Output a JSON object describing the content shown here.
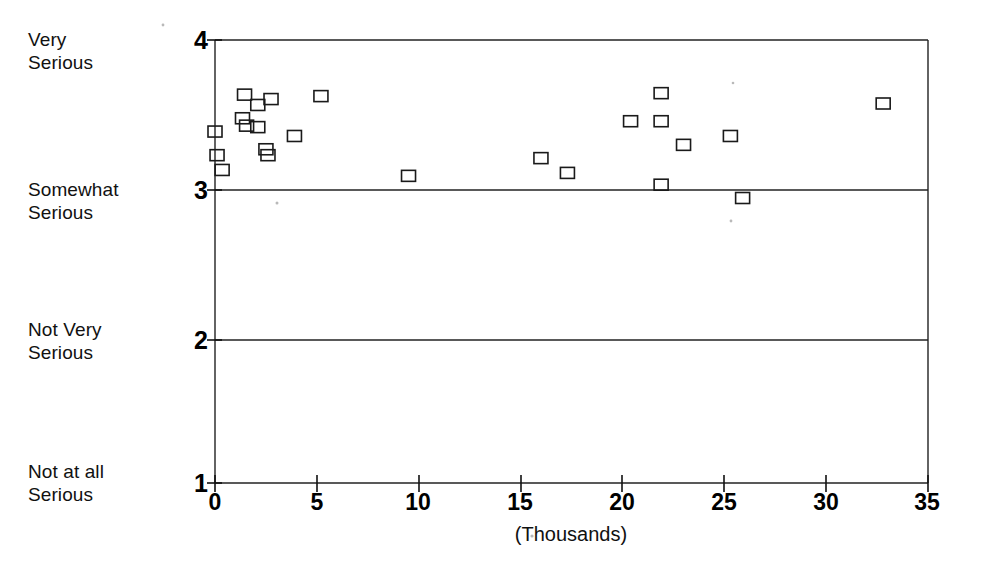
{
  "chart_data": {
    "type": "scatter",
    "title": "",
    "subtitle": "",
    "xlabel": "(Thousands)",
    "ylabel": "",
    "xlim": [
      0,
      35
    ],
    "ylim": [
      1,
      4
    ],
    "grid": true,
    "legend": null,
    "x_ticks": [
      0,
      5,
      10,
      15,
      20,
      25,
      30,
      35
    ],
    "x_tick_labels": [
      "0",
      "5",
      "10",
      "15",
      "20",
      "25",
      "30",
      "35"
    ],
    "y_ticks": [
      1,
      2,
      3,
      4
    ],
    "y_tick_labels": [
      "1",
      "2",
      "3",
      "4"
    ],
    "y_category_labels": [
      {
        "value": 4,
        "label": "Very\nSerious"
      },
      {
        "value": 3,
        "label": "Somewhat\nSerious"
      },
      {
        "value": 2,
        "label": "Not Very\nSerious"
      },
      {
        "value": 1,
        "label": "Not at all\nSerious"
      }
    ],
    "marker": "open-square",
    "marker_color": "#1a1a1a",
    "series": [
      {
        "name": "observations",
        "points": [
          {
            "x": 0.0,
            "y": 3.38
          },
          {
            "x": 0.1,
            "y": 3.22
          },
          {
            "x": 0.35,
            "y": 3.12
          },
          {
            "x": 1.45,
            "y": 3.63
          },
          {
            "x": 1.35,
            "y": 3.47
          },
          {
            "x": 1.55,
            "y": 3.42
          },
          {
            "x": 2.1,
            "y": 3.56
          },
          {
            "x": 2.75,
            "y": 3.6
          },
          {
            "x": 2.1,
            "y": 3.41
          },
          {
            "x": 2.5,
            "y": 3.26
          },
          {
            "x": 2.6,
            "y": 3.22
          },
          {
            "x": 3.9,
            "y": 3.35
          },
          {
            "x": 5.2,
            "y": 3.62
          },
          {
            "x": 9.5,
            "y": 3.08
          },
          {
            "x": 16.0,
            "y": 3.2
          },
          {
            "x": 17.3,
            "y": 3.1
          },
          {
            "x": 20.4,
            "y": 3.45
          },
          {
            "x": 21.9,
            "y": 3.64
          },
          {
            "x": 21.9,
            "y": 3.45
          },
          {
            "x": 21.9,
            "y": 3.02
          },
          {
            "x": 23.0,
            "y": 3.29
          },
          {
            "x": 25.3,
            "y": 3.35
          },
          {
            "x": 25.9,
            "y": 2.93
          },
          {
            "x": 32.8,
            "y": 3.57
          }
        ]
      }
    ]
  },
  "axis": {
    "x_caption": "(Thousands)"
  }
}
